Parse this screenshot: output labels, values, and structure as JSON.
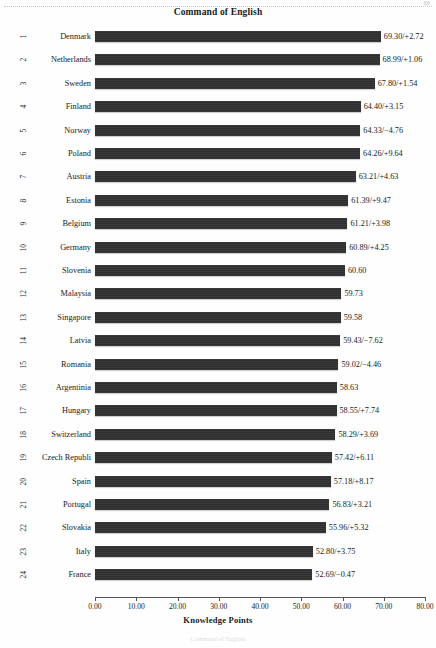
{
  "page": {
    "folio": "69",
    "footnote": "Command of English"
  },
  "chart_data": {
    "type": "bar",
    "orientation": "horizontal",
    "title": "Command of English",
    "xlabel": "Knowledge Points",
    "ylabel": "",
    "xlim": [
      0.0,
      80.0
    ],
    "xticks": [
      "0.00",
      "10.00",
      "20.00",
      "30.00",
      "40.00",
      "50.00",
      "60.00",
      "70.00",
      "80.00"
    ],
    "xtick_values": [
      0,
      10,
      20,
      30,
      40,
      50,
      60,
      70,
      80
    ],
    "grid": false,
    "legend": "none",
    "bar_color": "#333333",
    "categories": [
      "Denmark",
      "Netherlands",
      "Sweden",
      "Finland",
      "Norway",
      "Poland",
      "Austria",
      "Estonia",
      "Belgium",
      "Germany",
      "Slovenia",
      "Malaysia",
      "Singapore",
      "Latvia",
      "Romania",
      "Argentinia",
      "Hungary",
      "Switzerland",
      "Czech Republi",
      "Spain",
      "Portugal",
      "Slovakia",
      "Italy",
      "France"
    ],
    "values": [
      69.3,
      68.99,
      67.8,
      64.4,
      64.33,
      64.26,
      63.21,
      61.39,
      61.21,
      60.89,
      60.6,
      59.73,
      59.58,
      59.43,
      59.02,
      58.63,
      58.55,
      58.29,
      57.42,
      57.18,
      56.83,
      55.96,
      52.8,
      52.69
    ],
    "deltas": [
      "+2.72",
      "+1.06",
      "+1.54",
      "+3.15",
      "-4.76",
      "+9.64",
      "+4.63",
      "+9.47",
      "+3.98",
      "+4.25",
      null,
      null,
      null,
      "-7.62",
      "-4.46",
      null,
      "+7.74",
      "+3.69",
      "+6.11",
      "+8.17",
      "+3.21",
      "+5.32",
      "+3.75",
      "-0.47"
    ],
    "rows": [
      {
        "rank": "1",
        "country": "Denmark",
        "value": 69.3,
        "label": "69.30/+2.72"
      },
      {
        "rank": "2",
        "country": "Netherlands",
        "value": 68.99,
        "label": "68.99/+1.06"
      },
      {
        "rank": "3",
        "country": "Sweden",
        "value": 67.8,
        "label": "67.80/+1.54"
      },
      {
        "rank": "4",
        "country": "Finland",
        "value": 64.4,
        "label": "64.40/+3.15"
      },
      {
        "rank": "5",
        "country": "Norway",
        "value": 64.33,
        "label": "64.33/−4.76"
      },
      {
        "rank": "6",
        "country": "Poland",
        "value": 64.26,
        "label": "64.26/+9.64"
      },
      {
        "rank": "7",
        "country": "Austria",
        "value": 63.21,
        "label": "63.21/+4.63"
      },
      {
        "rank": "8",
        "country": "Estonia",
        "value": 61.39,
        "label": "61.39/+9.47"
      },
      {
        "rank": "9",
        "country": "Belgium",
        "value": 61.21,
        "label": "61.21/+3.98"
      },
      {
        "rank": "10",
        "country": "Germany",
        "value": 60.89,
        "label": "60.89/+4.25"
      },
      {
        "rank": "11",
        "country": "Slovenia",
        "value": 60.6,
        "label": "60.60"
      },
      {
        "rank": "12",
        "country": "Malaysia",
        "value": 59.73,
        "label": "59.73"
      },
      {
        "rank": "13",
        "country": "Singapore",
        "value": 59.58,
        "label": "59.58"
      },
      {
        "rank": "14",
        "country": "Latvia",
        "value": 59.43,
        "label": "59.43/−7.62"
      },
      {
        "rank": "15",
        "country": "Romania",
        "value": 59.02,
        "label": "59.02/−4.46"
      },
      {
        "rank": "16",
        "country": "Argentinia",
        "value": 58.63,
        "label": "58.63"
      },
      {
        "rank": "17",
        "country": "Hungary",
        "value": 58.55,
        "label": "58.55/+7.74"
      },
      {
        "rank": "18",
        "country": "Switzerland",
        "value": 58.29,
        "label": "58.29/+3.69"
      },
      {
        "rank": "19",
        "country": "Czech Republi",
        "value": 57.42,
        "label": "57.42/+6.11"
      },
      {
        "rank": "20",
        "country": "Spain",
        "value": 57.18,
        "label": "57.18/+8.17"
      },
      {
        "rank": "21",
        "country": "Portugal",
        "value": 56.83,
        "label": "56.83/+3.21"
      },
      {
        "rank": "22",
        "country": "Slovakia",
        "value": 55.96,
        "label": "55.96/+5.32"
      },
      {
        "rank": "23",
        "country": "Italy",
        "value": 52.8,
        "label": "52.80/+3.75"
      },
      {
        "rank": "24",
        "country": "France",
        "value": 52.69,
        "label": "52.69/−0.47"
      }
    ]
  }
}
